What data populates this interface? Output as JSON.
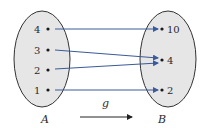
{
  "diagram": {
    "type": "function-mapping",
    "function_name": "g",
    "domain_set": {
      "name": "A",
      "elements": [
        "4",
        "3",
        "2",
        "1"
      ]
    },
    "codomain_set": {
      "name": "B",
      "elements": [
        "10",
        "4",
        "2"
      ]
    },
    "mappings": [
      {
        "from": "4",
        "to": "10"
      },
      {
        "from": "3",
        "to": "4"
      },
      {
        "from": "2",
        "to": "4"
      },
      {
        "from": "1",
        "to": "2"
      }
    ],
    "colors": {
      "arrow": "#3a5a9a",
      "ellipse_fill": "#e6e6e6",
      "ellipse_stroke": "#333333",
      "dot": "#1a1a1a"
    }
  }
}
